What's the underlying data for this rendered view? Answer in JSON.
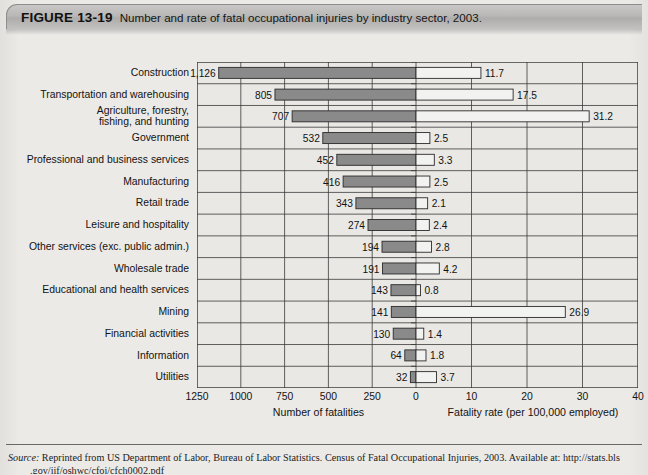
{
  "figure": {
    "number": "FIGURE 13-19",
    "caption": "Number and rate of fatal occupational injuries by industry sector, 2003."
  },
  "source": {
    "label": "Source:",
    "text": " Reprinted from US Department of Labor, Bureau of Labor Statistics. Census of Fatal Occupational Injuries, 2003. Available at: http://stats.bls",
    "line2": ".gov/iif/oshwc/cfoi/cfch0002.pdf"
  },
  "colors": {
    "bar_fatalities_fill": "#8a8a8a",
    "bar_rate_fill": "#f2f2f0",
    "bar_stroke": "#2a2a2a",
    "plot_bg": "#e9e8e5",
    "grid": "#3a3a3a",
    "banner": "#bbbab8"
  },
  "chart_data": {
    "type": "bar",
    "orientation": "horizontal-bidirectional",
    "title": "Number and rate of fatal occupational injuries by industry sector, 2003",
    "categories": [
      "Construction",
      "Transportation and warehousing",
      "Agriculture, forestry,\nfishing, and hunting",
      "Government",
      "Professional and business services",
      "Manufacturing",
      "Retail trade",
      "Leisure and hospitality",
      "Other services (exc. public admin.)",
      "Wholesale trade",
      "Educational and health services",
      "Mining",
      "Financial activities",
      "Information",
      "Utilities"
    ],
    "series": [
      {
        "name": "Number of fatalities",
        "side": "left",
        "axis_label": "Number of fatalities",
        "ticks": [
          1250,
          1000,
          750,
          500,
          250,
          0
        ],
        "tick_labels": [
          "1250",
          "1000",
          "750",
          "500",
          "250",
          "0"
        ],
        "max": 1250,
        "values": [
          1126,
          805,
          707,
          532,
          452,
          416,
          343,
          274,
          194,
          191,
          143,
          141,
          130,
          64,
          32
        ],
        "value_labels": [
          "1,126",
          "805",
          "707",
          "532",
          "452",
          "416",
          "343",
          "274",
          "194",
          "191",
          "143",
          "141",
          "130",
          "64",
          "32"
        ]
      },
      {
        "name": "Fatality rate (per 100,000 employed)",
        "side": "right",
        "axis_label": "Fatality rate (per 100,000 employed)",
        "ticks": [
          0,
          10,
          20,
          30,
          40
        ],
        "tick_labels": [
          "0",
          "10",
          "20",
          "30",
          "40"
        ],
        "max": 40,
        "values": [
          11.7,
          17.5,
          31.2,
          2.5,
          3.3,
          2.5,
          2.1,
          2.4,
          2.8,
          4.2,
          0.8,
          26.9,
          1.4,
          1.8,
          3.7
        ],
        "value_labels": [
          "11.7",
          "17.5",
          "31.2",
          "2.5",
          "3.3",
          "2.5",
          "2.1",
          "2.4",
          "2.8",
          "4.2",
          "0.8",
          "26.9",
          "1.4",
          "1.8",
          "3.7"
        ]
      }
    ],
    "grid": true,
    "legend": "none"
  }
}
